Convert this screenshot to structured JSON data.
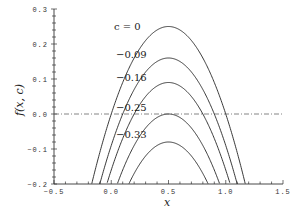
{
  "chart_data": {
    "type": "line",
    "title": "",
    "xlabel": "x",
    "ylabel": "f(x,c)",
    "xlim": [
      -0.5,
      1.5
    ],
    "ylim": [
      -0.2,
      0.3
    ],
    "xticks": [
      "-0.5",
      "0.0",
      "0.5",
      "1.0",
      "1.5"
    ],
    "yticks": [
      "0.3",
      "0.2",
      "0.1",
      "0.0",
      "-0.1",
      "-0.2"
    ],
    "function": "f(x,c) = x(1-x) + c",
    "reference_line": {
      "y": 0.0,
      "style": "dash-dot"
    },
    "series": [
      {
        "name": "c = 0",
        "c": 0,
        "peak": {
          "x": 0.5,
          "y": 0.25
        }
      },
      {
        "name": "-0.09",
        "c": -0.09,
        "peak": {
          "x": 0.5,
          "y": 0.16
        }
      },
      {
        "name": "-0.16",
        "c": -0.16,
        "peak": {
          "x": 0.5,
          "y": 0.09
        }
      },
      {
        "name": "-0.25",
        "c": -0.25,
        "peak": {
          "x": 0.5,
          "y": 0.0
        }
      },
      {
        "name": "-0.33",
        "c": -0.33,
        "peak": {
          "x": 0.5,
          "y": -0.08
        }
      }
    ],
    "grid": false,
    "legend": "inline labels above curve peaks"
  },
  "labels": {
    "c0": "c = 0",
    "c1": "−0.09",
    "c2": "−0.16",
    "c3": "−0.25",
    "c4": "−0.33",
    "xlabel": "x",
    "ylabel": "f(x, c)"
  }
}
